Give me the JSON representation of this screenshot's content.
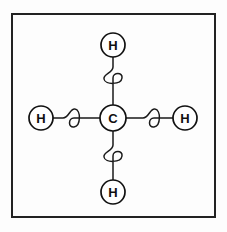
{
  "figure": {
    "name": "methane-molecule-diagram",
    "background_color": "#fdfdfd"
  },
  "frame": {
    "name": "diagram-border",
    "x": 12,
    "y": 14,
    "width": 203,
    "height": 203,
    "stroke_color": "#222222",
    "stroke_width": 2
  },
  "atoms": [
    {
      "id": "carbon-center",
      "label": "C",
      "element": "Carbon",
      "cx": 113,
      "cy": 118,
      "r": 13,
      "position": "center"
    },
    {
      "id": "hydrogen-top",
      "label": "H",
      "element": "Hydrogen",
      "cx": 113,
      "cy": 45,
      "r": 12,
      "position": "top"
    },
    {
      "id": "hydrogen-bottom",
      "label": "H",
      "element": "Hydrogen",
      "cx": 113,
      "cy": 192,
      "r": 12,
      "position": "bottom"
    },
    {
      "id": "hydrogen-left",
      "label": "H",
      "element": "Hydrogen",
      "cx": 41,
      "cy": 118,
      "r": 12,
      "position": "left"
    },
    {
      "id": "hydrogen-right",
      "label": "H",
      "element": "Hydrogen",
      "cx": 185,
      "cy": 118,
      "r": 12,
      "position": "right"
    }
  ],
  "bonds": [
    {
      "id": "bond-c-h-top",
      "from": "carbon-center",
      "to": "hydrogen-top",
      "style": "spring",
      "orientation": "vertical"
    },
    {
      "id": "bond-c-h-bottom",
      "from": "carbon-center",
      "to": "hydrogen-bottom",
      "style": "spring",
      "orientation": "vertical"
    },
    {
      "id": "bond-c-h-left",
      "from": "carbon-center",
      "to": "hydrogen-left",
      "style": "spring",
      "orientation": "horizontal"
    },
    {
      "id": "bond-c-h-right",
      "from": "carbon-center",
      "to": "hydrogen-right",
      "style": "spring",
      "orientation": "horizontal"
    }
  ],
  "colors": {
    "line": "#1a1a1a",
    "atom_stroke": "#111111",
    "atom_fill": "#ffffff",
    "label_text": "#101010",
    "frame": "#222222"
  }
}
